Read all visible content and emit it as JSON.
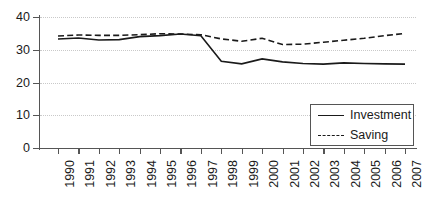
{
  "chart_data": {
    "type": "line",
    "title": "",
    "subtitle": "",
    "xlabel": "",
    "ylabel": "",
    "categories": [
      "1990",
      "1991",
      "1992",
      "1993",
      "1994",
      "1995",
      "1996",
      "1997",
      "1998",
      "1999",
      "2000",
      "2001",
      "2002",
      "2003",
      "2004",
      "2005",
      "2006",
      "2007"
    ],
    "series": [
      {
        "name": "Investment",
        "style": "solid",
        "values": [
          33.3,
          33.6,
          33.0,
          33.1,
          34.0,
          34.3,
          34.8,
          34.3,
          26.5,
          25.7,
          27.2,
          26.3,
          25.8,
          25.6,
          26.0,
          25.8,
          25.7,
          25.6
        ]
      },
      {
        "name": "Saving",
        "style": "dashed",
        "values": [
          34.2,
          34.5,
          34.4,
          34.4,
          34.6,
          34.9,
          34.8,
          34.6,
          33.3,
          32.6,
          33.5,
          31.6,
          31.7,
          32.3,
          32.9,
          33.5,
          34.3,
          35.0
        ]
      }
    ],
    "xticks": [
      "1990",
      "1991",
      "1992",
      "1993",
      "1994",
      "1995",
      "1996",
      "1997",
      "1998",
      "1999",
      "2000",
      "2001",
      "2002",
      "2003",
      "2004",
      "2005",
      "2006",
      "2007"
    ],
    "yticks": [
      "0",
      "10",
      "20",
      "30",
      "40"
    ],
    "ylim": [
      0,
      40
    ],
    "grid": "horizontal-dotted",
    "legend": {
      "position": "bottom-right-inside",
      "entries": [
        {
          "label": "Investment",
          "style": "solid"
        },
        {
          "label": "Saving",
          "style": "dashed"
        }
      ]
    },
    "colors": {
      "series_line": "#1a1a1a",
      "gridline": "#c9c9c9",
      "axis": "#555555",
      "background": "#ffffff"
    }
  }
}
